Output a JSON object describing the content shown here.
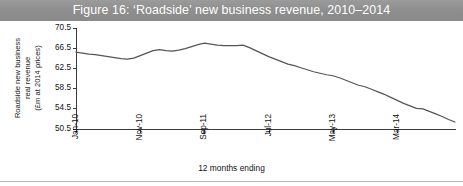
{
  "figure": {
    "title": "Figure 16: ‘Roadside’ new business revenue, 2010–2014",
    "banner_color": "#8f8f8f",
    "banner_text_color": "#ffffff",
    "line_color": "#555555",
    "axis_color": "#3a3a3a",
    "background": "#ffffff"
  },
  "axes": {
    "ylabel_line1": "Roadside new business",
    "ylabel_line2": "real revenue",
    "ylabel_line3": "(£m at 2014 prices)",
    "xlabel": "12 months ending",
    "yticks": [
      "70.5",
      "66.5",
      "62.5",
      "58.5",
      "54.5",
      "50.5"
    ],
    "xticks": [
      "Jan-10",
      "Nov-10",
      "Sep-11",
      "Jul-12",
      "May-13",
      "Mar-14"
    ]
  },
  "chart_data": {
    "type": "line",
    "title": "Figure 16: ‘Roadside’ new business revenue, 2010–2014",
    "xlabel": "12 months ending",
    "ylabel": "Roadside new business real revenue (£m at 2014 prices)",
    "ylim": [
      50.5,
      70.5
    ],
    "ytick_values": [
      70.5,
      66.5,
      62.5,
      58.5,
      54.5,
      50.5
    ],
    "grid": false,
    "legend": false,
    "xtick_labels": [
      "Jan-10",
      "Nov-10",
      "Sep-11",
      "Jul-12",
      "May-13",
      "Mar-14"
    ],
    "xtick_indices": [
      0,
      10,
      20,
      30,
      40,
      50
    ],
    "x": [
      "Jan-10",
      "Feb-10",
      "Mar-10",
      "Apr-10",
      "May-10",
      "Jun-10",
      "Jul-10",
      "Aug-10",
      "Sep-10",
      "Oct-10",
      "Nov-10",
      "Dec-10",
      "Jan-11",
      "Feb-11",
      "Mar-11",
      "Apr-11",
      "May-11",
      "Jun-11",
      "Jul-11",
      "Aug-11",
      "Sep-11",
      "Oct-11",
      "Nov-11",
      "Dec-11",
      "Jan-12",
      "Feb-12",
      "Mar-12",
      "Apr-12",
      "May-12",
      "Jun-12",
      "Jul-12",
      "Aug-12",
      "Sep-12",
      "Oct-12",
      "Nov-12",
      "Dec-12",
      "Jan-13",
      "Feb-13",
      "Mar-13",
      "Apr-13",
      "May-13",
      "Jun-13",
      "Jul-13",
      "Aug-13",
      "Sep-13",
      "Oct-13",
      "Nov-13",
      "Dec-13",
      "Jan-14",
      "Feb-14",
      "Mar-14",
      "Apr-14",
      "May-14",
      "Jun-14",
      "Jul-14",
      "Aug-14",
      "Sep-14",
      "Oct-14",
      "Nov-14",
      "Dec-14"
    ],
    "series": [
      {
        "name": "Roadside new business real revenue",
        "values": [
          65.7,
          65.5,
          65.3,
          65.2,
          65.0,
          64.8,
          64.6,
          64.4,
          64.3,
          64.5,
          65.0,
          65.5,
          66.0,
          66.2,
          66.0,
          65.9,
          66.1,
          66.4,
          66.8,
          67.2,
          67.5,
          67.3,
          67.1,
          67.0,
          67.0,
          67.0,
          67.1,
          66.6,
          66.0,
          65.4,
          64.8,
          64.3,
          63.8,
          63.3,
          63.0,
          62.6,
          62.2,
          61.8,
          61.5,
          61.2,
          61.0,
          60.6,
          60.1,
          59.6,
          59.1,
          58.8,
          58.3,
          57.8,
          57.3,
          56.7,
          56.1,
          55.5,
          55.0,
          54.5,
          54.4,
          53.9,
          53.4,
          52.9,
          52.3,
          51.8
        ]
      }
    ]
  }
}
